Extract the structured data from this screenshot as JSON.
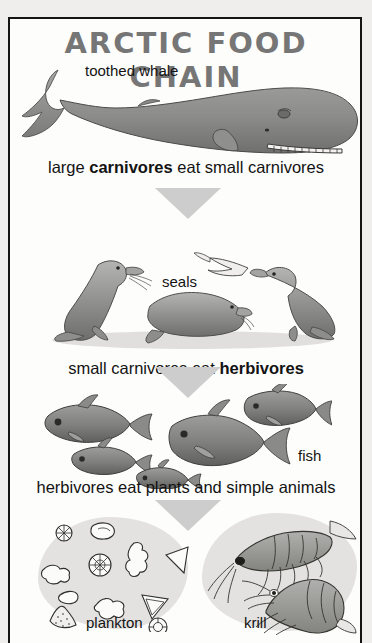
{
  "poster": {
    "title": "ARCTIC FOOD CHAIN",
    "border_color": "#141414",
    "background_color": "#fdfdfc",
    "title_color": "#767676",
    "arrow_color": "#cdcdcd"
  },
  "levels": [
    {
      "id": "toothed-whale",
      "label": "toothed whale",
      "caption_plain": "large carnivores eat small carnivores",
      "caption_pre": "large ",
      "caption_bold": "carnivores",
      "caption_post": " eat small carnivores"
    },
    {
      "id": "seals",
      "label": "seals",
      "caption_plain": "small carnivores eat herbivores",
      "caption_pre": "small carnivores eat ",
      "caption_bold": "herbivores",
      "caption_post": ""
    },
    {
      "id": "fish",
      "label": "fish",
      "caption_plain": "herbivores eat plants and simple animals",
      "caption_pre": "herbivores eat plants and simple animals",
      "caption_bold": "",
      "caption_post": ""
    },
    {
      "id": "plankton-krill",
      "label_left": "plankton",
      "label_right": "krill"
    }
  ],
  "arrows": [
    {
      "name": "arrow-whale-to-seals"
    },
    {
      "name": "arrow-seals-to-fish"
    },
    {
      "name": "arrow-fish-to-plankton"
    }
  ],
  "icons": {
    "whale": "whale-illustration",
    "seal": "seal-illustration",
    "fish": "fish-illustration",
    "plankton": "plankton-illustration",
    "krill": "krill-illustration"
  }
}
